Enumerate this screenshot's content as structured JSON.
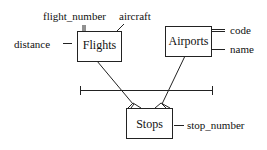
{
  "diagram": {
    "type": "entity-relationship",
    "entities": [
      {
        "name": "Flights",
        "attributes": [
          "flight_number",
          "aircraft",
          "distance"
        ],
        "key": "flight_number"
      },
      {
        "name": "Airports",
        "attributes": [
          "code",
          "name"
        ],
        "key": "code"
      },
      {
        "name": "Stops",
        "attributes": [
          "stop_number"
        ]
      }
    ],
    "relationships": [
      {
        "from": "Flights",
        "to": "Stops",
        "cardinality": "one-to-many"
      },
      {
        "from": "Airports",
        "to": "Stops",
        "cardinality": "one-to-many"
      }
    ],
    "labels": {
      "flights": "Flights",
      "airports": "Airports",
      "stops": "Stops",
      "flight_number": "flight_number",
      "aircraft": "aircraft",
      "distance": "distance",
      "code": "code",
      "name": "name",
      "stop_number": "stop_number"
    }
  }
}
